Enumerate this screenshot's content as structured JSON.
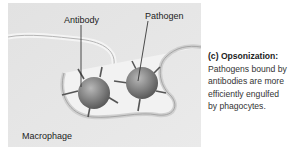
{
  "figure": {
    "labels": {
      "antibody": "Antibody",
      "pathogen": "Pathogen",
      "macrophage": "Macrophage"
    }
  },
  "caption": {
    "title": "(c) Opsonization:",
    "lines": [
      "Pathogens bound by",
      "antibodies are more",
      "efficiently engulfed",
      "by phagocytes."
    ]
  }
}
